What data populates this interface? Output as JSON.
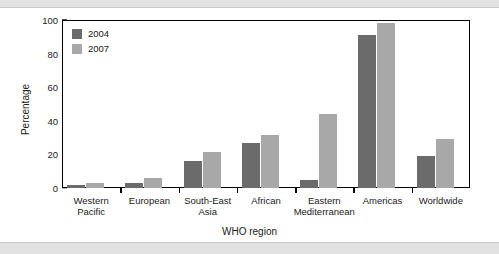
{
  "chart_data": {
    "type": "bar",
    "title": "",
    "xlabel": "WHO region",
    "ylabel": "Percentage",
    "ylim": [
      0,
      100
    ],
    "yticks": [
      0,
      20,
      40,
      60,
      80,
      100
    ],
    "ytick_labels": [
      "0",
      "20",
      "40",
      "60",
      "80",
      "100"
    ],
    "grid": false,
    "legend_position": "top-left",
    "categories": [
      "Western Pacific",
      "European",
      "South-East Asia",
      "African",
      "Eastern Mediterranean",
      "Americas",
      "Worldwide"
    ],
    "category_lines": [
      [
        "Western",
        "Pacific"
      ],
      [
        "European",
        ""
      ],
      [
        "South-East",
        "Asia"
      ],
      [
        "African",
        ""
      ],
      [
        "Eastern",
        "Mediterranean"
      ],
      [
        "Americas",
        ""
      ],
      [
        "Worldwide",
        ""
      ]
    ],
    "series": [
      {
        "name": "2004",
        "color": "#6b6b6b",
        "values": [
          2,
          3,
          16,
          26.5,
          5,
          91,
          19
        ]
      },
      {
        "name": "2007",
        "color": "#a8a8a8",
        "values": [
          3,
          6,
          21.5,
          31.5,
          44,
          98,
          29
        ]
      }
    ]
  },
  "legend": {
    "entries": [
      {
        "label": "2004",
        "color": "#6b6b6b"
      },
      {
        "label": "2007",
        "color": "#a8a8a8"
      }
    ]
  },
  "colors": {
    "series_2004": "#6b6b6b",
    "series_2007": "#a8a8a8",
    "axis": "#000000",
    "band": "#e2e2e2",
    "background": "#ffffff"
  }
}
